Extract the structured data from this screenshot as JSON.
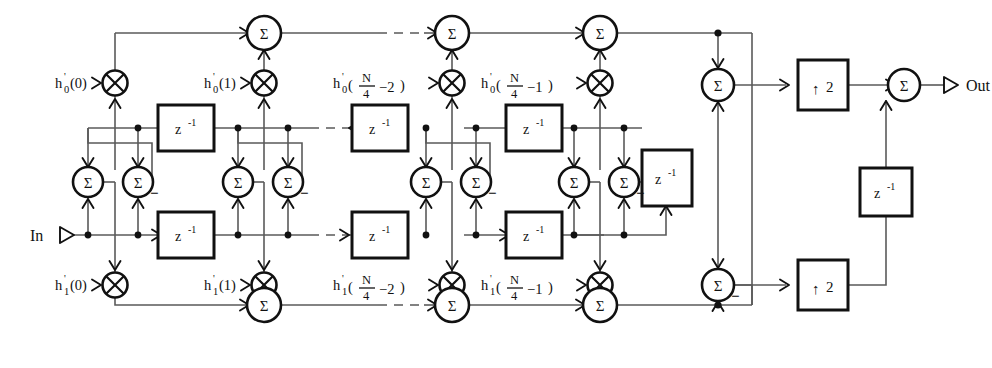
{
  "diagram": {
    "io": {
      "input_label": "In",
      "output_label": "Out"
    },
    "symbols": {
      "sum": "Σ",
      "minus": "−",
      "delay": "z",
      "delay_exp": "-1",
      "upsample": "2",
      "up_arrow": "↑",
      "multiply": "⊗"
    },
    "coefficients_top": [
      {
        "base": "h",
        "sub": "0",
        "prime": "'",
        "arg": "(0)",
        "kind": "simple",
        "label": "h'0(0)"
      },
      {
        "base": "h",
        "sub": "0",
        "prime": "'",
        "arg": "(1)",
        "kind": "simple",
        "label": "h'0(1)"
      },
      {
        "base": "h",
        "sub": "0",
        "prime": "'",
        "num": "N",
        "den": "4",
        "off": "−2",
        "kind": "frac",
        "label": "h'0(N/4 - 2)"
      },
      {
        "base": "h",
        "sub": "0",
        "prime": "'",
        "num": "N",
        "den": "4",
        "off": "−1",
        "kind": "frac",
        "label": "h'0(N/4 - 1)"
      }
    ],
    "coefficients_bottom": [
      {
        "base": "h",
        "sub": "1",
        "prime": "'",
        "arg": "(0)",
        "kind": "simple",
        "label": "h'1(0)"
      },
      {
        "base": "h",
        "sub": "1",
        "prime": "'",
        "arg": "(1)",
        "kind": "simple",
        "label": "h'1(1)"
      },
      {
        "base": "h",
        "sub": "1",
        "prime": "'",
        "num": "N",
        "den": "4",
        "off": "−2",
        "kind": "frac",
        "label": "h'1(N/4 - 2)"
      },
      {
        "base": "h",
        "sub": "1",
        "prime": "'",
        "num": "N",
        "den": "4",
        "off": "−1",
        "kind": "frac",
        "label": "h'1(N/4 - 1)"
      }
    ],
    "delay_blocks": {
      "upper_row_count": 3,
      "lower_row_count": 3,
      "butterfly_tail": 1,
      "output_feedback": 1,
      "text": "z",
      "exponent": "-1"
    },
    "upsamplers": [
      {
        "factor": "2",
        "arrow": "↑",
        "position": "upper"
      },
      {
        "factor": "2",
        "arrow": "↑",
        "position": "lower"
      }
    ],
    "summers": {
      "top_row": 4,
      "bottom_row": 4,
      "butterfly_pairs": 4,
      "output_stage": 3,
      "negated_marker": "−"
    },
    "colors": {
      "background": "#ffffff",
      "wire": "#5a5a5a",
      "ink": "#111111"
    }
  }
}
